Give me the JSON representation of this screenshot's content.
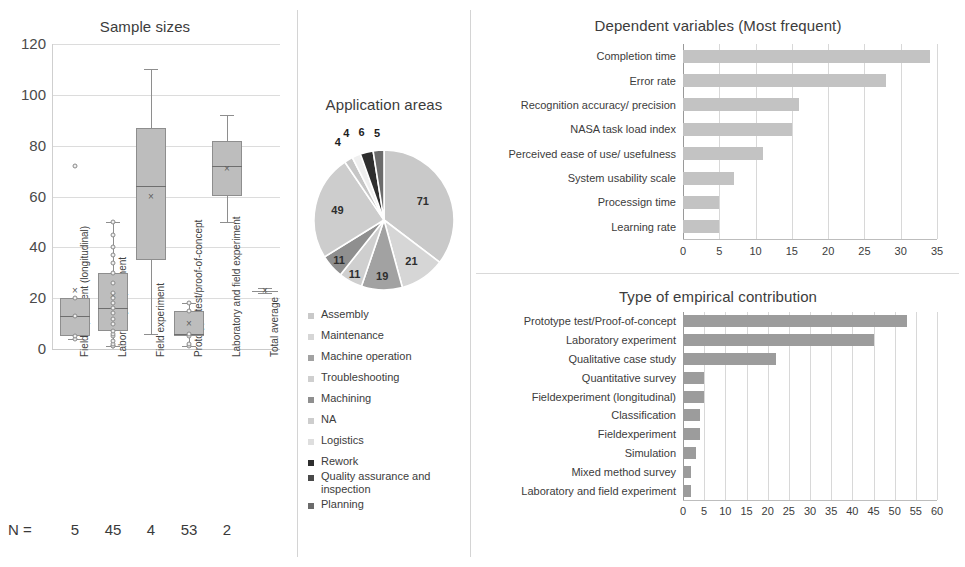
{
  "colors": {
    "box_fill": "#bdbdbd",
    "box_stroke": "#8e8e8e",
    "bar_top": "#c3c3c3",
    "bar_bottom": "#9c9c9c",
    "grid": "#dcdcdc",
    "text": "#3c3c3c"
  },
  "chart_data": [
    {
      "id": "sample-sizes",
      "type": "boxplot",
      "title": "Sample sizes",
      "xlabel": "",
      "ylabel": "",
      "ylim": [
        0,
        120
      ],
      "yticks": [
        0,
        20,
        40,
        60,
        80,
        100,
        120
      ],
      "grid": true,
      "n_label": "N =",
      "categories": [
        "Fieldexperiment (longitudinal)",
        "Laboratory experiment",
        "Field experiment",
        "Prototype test/proof-of-concept",
        "Laboratory and field experiment",
        "Total average"
      ],
      "n_values": [
        "5",
        "45",
        "4",
        "53",
        "2"
      ],
      "boxes": [
        {
          "category": "Fieldexperiment (longitudinal)",
          "min": 4,
          "q1": 5,
          "median": 13,
          "q3": 20,
          "max": 20,
          "mean": 23,
          "outliers": [
            72
          ],
          "points": [
            4,
            5,
            13,
            20
          ]
        },
        {
          "category": "Laboratory experiment",
          "min": 1,
          "q1": 7,
          "median": 16,
          "q3": 30,
          "max": 50,
          "mean": 21,
          "outliers": [],
          "points": [
            1,
            1,
            2,
            3,
            5,
            6,
            7,
            10,
            12,
            14,
            16,
            18,
            20,
            22,
            26,
            30,
            34,
            37,
            40,
            45,
            50
          ]
        },
        {
          "category": "Field experiment",
          "min": 6,
          "q1": 35,
          "median": 64,
          "q3": 87,
          "max": 110,
          "mean": 60,
          "outliers": [],
          "points": []
        },
        {
          "category": "Prototype test/proof-of-concept",
          "min": 1,
          "q1": 5,
          "median": 6,
          "q3": 15,
          "max": 18,
          "mean": 10,
          "outliers": [],
          "points": [
            1,
            2,
            5,
            6,
            15,
            18
          ]
        },
        {
          "category": "Laboratory and field experiment",
          "min": 50,
          "q1": 60,
          "median": 72,
          "q3": 82,
          "max": 92,
          "mean": 71,
          "outliers": [],
          "points": []
        },
        {
          "category": "Total average",
          "min": 22,
          "q1": 22,
          "median": 23,
          "q3": 23,
          "max": 24,
          "mean": 23,
          "outliers": [],
          "points": []
        }
      ]
    },
    {
      "id": "application-areas",
      "type": "pie",
      "title": "Application areas",
      "labels": [
        "Assembly",
        "Maintenance",
        "Machine operation",
        "Troubleshooting",
        "Machining",
        "NA",
        "Logistics",
        "Rework",
        "Quality assurance and inspection",
        "Planning"
      ],
      "values": [
        71,
        21,
        19,
        11,
        11,
        49,
        4,
        4,
        6,
        5
      ],
      "slice_colors": [
        "#c9c9c9",
        "#d6d6d6",
        "#a2a2a2",
        "#cfcfcf",
        "#8f8f8f",
        "#cdcdcd",
        "#c6c6c6",
        "#efefef",
        "#2e2e2e",
        "#6b6b6b"
      ],
      "legend_colors": [
        "#c9c9c9",
        "#d6d6d6",
        "#a2a2a2",
        "#cfcfcf",
        "#8f8f8f",
        "#cdcdcd",
        "#dedede",
        "#2e2e2e",
        "#4a4a4a",
        "#6b6b6b"
      ],
      "legend_position": "below"
    },
    {
      "id": "dependent-variables",
      "type": "bar",
      "orientation": "horizontal",
      "title": "Dependent variables (Most frequent)",
      "categories": [
        "Completion time",
        "Error rate",
        "Recognition accuracy/ precision",
        "NASA task load index",
        "Perceived ease of use/ usefulness",
        "System usability scale",
        "Processign time",
        "Learning rate"
      ],
      "values": [
        34,
        28,
        16,
        15,
        11,
        7,
        5,
        5
      ],
      "xlabel": "",
      "ylabel": "",
      "xlim": [
        0,
        35
      ],
      "xticks": [
        0,
        5,
        10,
        15,
        20,
        25,
        30,
        35
      ],
      "grid": true
    },
    {
      "id": "empirical-contribution",
      "type": "bar",
      "orientation": "horizontal",
      "title": "Type of empirical contribution",
      "categories": [
        "Prototype test/Proof-of-concept",
        "Laboratory experiment",
        "Qualitative case study",
        "Quantitative survey",
        "Fieldexperiment (longitudinal)",
        "Classification",
        "Fieldexperiment",
        "Simulation",
        "Mixed method survey",
        "Laboratory and field experiment"
      ],
      "values": [
        53,
        45,
        22,
        5,
        5,
        4,
        4,
        3,
        2,
        2
      ],
      "xlabel": "",
      "ylabel": "",
      "xlim": [
        0,
        60
      ],
      "xticks": [
        0,
        5,
        10,
        15,
        20,
        25,
        30,
        35,
        40,
        45,
        50,
        55,
        60
      ],
      "grid": true
    }
  ]
}
